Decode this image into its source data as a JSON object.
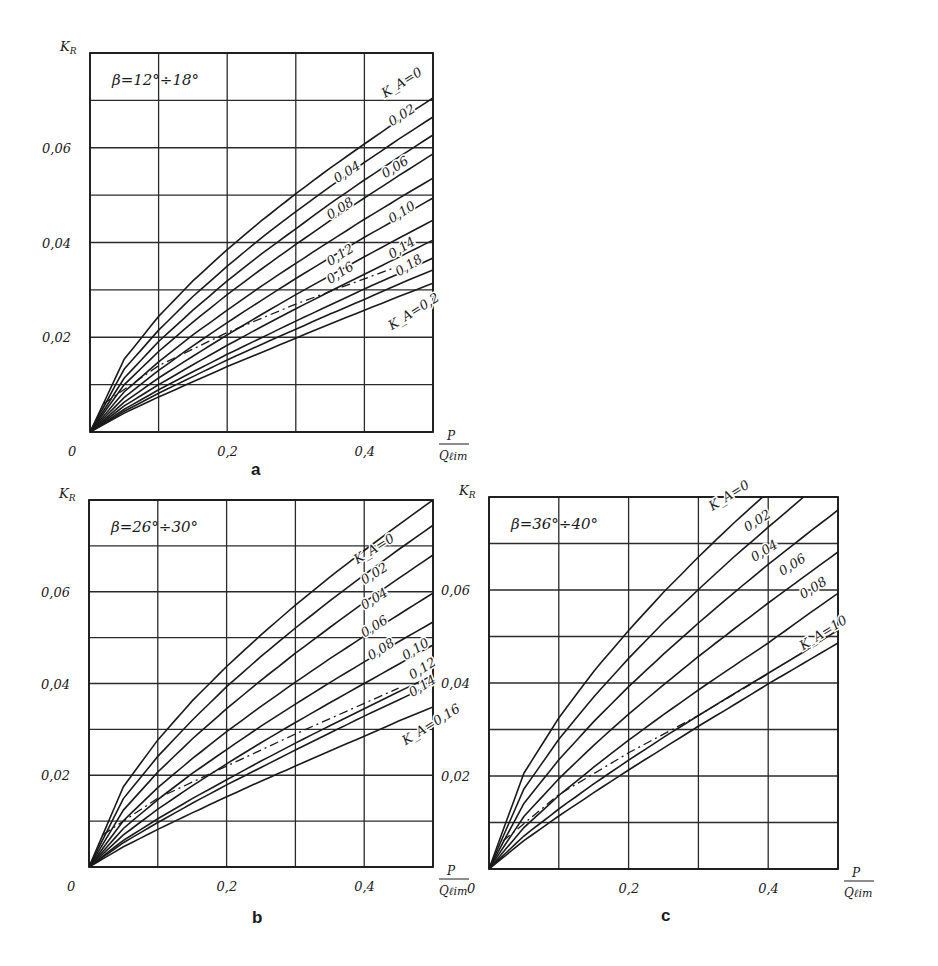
{
  "chart_data": [
    {
      "panel": "a",
      "type": "line",
      "title": "β=12°÷18°",
      "xlabel": "P / Q_lim",
      "ylabel": "K_R",
      "xlim": [
        0,
        0.5
      ],
      "ylim": [
        0,
        0.08
      ],
      "grid": true,
      "x_ticks": [
        "0",
        "0,2",
        "0,4"
      ],
      "y_ticks": [
        "0,02",
        "0,04",
        "0,06"
      ],
      "x": [
        0,
        0.05,
        0.1,
        0.15,
        0.2,
        0.25,
        0.3,
        0.35,
        0.4,
        0.45,
        0.5
      ],
      "series": [
        {
          "name": "K_A=0",
          "label": "K_A=0",
          "values": [
            0,
            0.0154,
            0.0244,
            0.0319,
            0.0385,
            0.0446,
            0.0503,
            0.0557,
            0.0608,
            0.0658,
            0.0705
          ]
        },
        {
          "name": "K_A=0.02",
          "label": "0,02",
          "values": [
            0,
            0.0133,
            0.0215,
            0.0286,
            0.035,
            0.041,
            0.0465,
            0.0518,
            0.0569,
            0.0618,
            0.0665
          ]
        },
        {
          "name": "K_A=0.04",
          "label": "0,04",
          "values": [
            0,
            0.0114,
            0.0191,
            0.0257,
            0.0319,
            0.0376,
            0.0429,
            0.0482,
            0.0532,
            0.058,
            0.0627
          ]
        },
        {
          "name": "K_A=0.06",
          "label": "0,06",
          "values": [
            0,
            0.01,
            0.017,
            0.0232,
            0.029,
            0.0344,
            0.0396,
            0.0446,
            0.0494,
            0.0541,
            0.0587
          ]
        },
        {
          "name": "K_A=0.08",
          "label": "0,08",
          "values": [
            0,
            0.0085,
            0.0148,
            0.0205,
            0.0257,
            0.0308,
            0.0356,
            0.0403,
            0.0449,
            0.0493,
            0.0536
          ]
        },
        {
          "name": "K_A=0.10",
          "label": "0,10",
          "values": [
            0,
            0.0073,
            0.013,
            0.0182,
            0.0231,
            0.0278,
            0.0324,
            0.0368,
            0.0411,
            0.0452,
            0.0494
          ]
        },
        {
          "name": "K_A=0.12",
          "label": "0,12",
          "values": [
            0,
            0.0063,
            0.0114,
            0.016,
            0.0205,
            0.0248,
            0.029,
            0.033,
            0.037,
            0.0409,
            0.0447
          ]
        },
        {
          "name": "K_A=0.14",
          "label": "0,14",
          "values": [
            0,
            0.0055,
            0.01,
            0.0142,
            0.0183,
            0.0222,
            0.026,
            0.0297,
            0.0333,
            0.0369,
            0.0405
          ]
        },
        {
          "name": "K_A=0.16",
          "label": "0,16",
          "values": [
            0,
            0.0048,
            0.0089,
            0.0127,
            0.0164,
            0.0199,
            0.0234,
            0.0268,
            0.0302,
            0.0334,
            0.0367
          ]
        },
        {
          "name": "K_A=0.18",
          "label": "0,18",
          "values": [
            0,
            0.0044,
            0.0082,
            0.0117,
            0.0152,
            0.0185,
            0.0217,
            0.0249,
            0.028,
            0.0312,
            0.0342
          ]
        },
        {
          "name": "K_A=0.2",
          "label": "K_A=0,2",
          "values": [
            0,
            0.004,
            0.0074,
            0.0106,
            0.0138,
            0.0168,
            0.0198,
            0.0228,
            0.0257,
            0.0286,
            0.0314
          ]
        }
      ],
      "dashed_line": {
        "x": [
          0.02,
          0.1,
          0.2,
          0.3,
          0.45
        ],
        "y": [
          0.006,
          0.014,
          0.021,
          0.027,
          0.035
        ]
      }
    },
    {
      "panel": "b",
      "type": "line",
      "title": "β=26°÷30°",
      "xlabel": "P / Q_lim",
      "ylabel": "K_R",
      "xlim": [
        0,
        0.5
      ],
      "ylim": [
        0,
        0.08
      ],
      "grid": true,
      "x_ticks": [
        "0",
        "0,2",
        "0,4"
      ],
      "y_ticks": [
        "0,02",
        "0,04",
        "0,06"
      ],
      "x": [
        0,
        0.05,
        0.1,
        0.15,
        0.2,
        0.25,
        0.3,
        0.35,
        0.4,
        0.45,
        0.5
      ],
      "series": [
        {
          "name": "K_A=0",
          "label": "K_A=0",
          "values": [
            0,
            0.0175,
            0.0277,
            0.0362,
            0.0437,
            0.0506,
            0.0571,
            0.0632,
            0.069,
            0.0746,
            0.08
          ]
        },
        {
          "name": "K_A=0.02",
          "label": "0,02",
          "values": [
            0,
            0.0149,
            0.0241,
            0.032,
            0.0393,
            0.0459,
            0.0521,
            0.058,
            0.0637,
            0.0692,
            0.0745
          ]
        },
        {
          "name": "K_A=0.04",
          "label": "0,04",
          "values": [
            0,
            0.0124,
            0.0207,
            0.0279,
            0.0345,
            0.0407,
            0.0466,
            0.0522,
            0.0577,
            0.0629,
            0.068
          ]
        },
        {
          "name": "K_A=0.06",
          "label": "0,06",
          "values": [
            0,
            0.0101,
            0.0173,
            0.0236,
            0.0295,
            0.035,
            0.0403,
            0.0454,
            0.0503,
            0.055,
            0.0597
          ]
        },
        {
          "name": "K_A=0.08",
          "label": "0,08",
          "values": [
            0,
            0.0084,
            0.0147,
            0.0204,
            0.0256,
            0.0307,
            0.0355,
            0.0402,
            0.0447,
            0.0491,
            0.0534
          ]
        },
        {
          "name": "K_A=0.10",
          "label": "0,10",
          "values": [
            0,
            0.007,
            0.0126,
            0.0177,
            0.0225,
            0.0271,
            0.0315,
            0.0358,
            0.04,
            0.0442,
            0.0484
          ]
        },
        {
          "name": "K_A=0.12",
          "label": "0,12",
          "values": [
            0,
            0.0058,
            0.0105,
            0.0149,
            0.019,
            0.0231,
            0.027,
            0.0308,
            0.0345,
            0.0382,
            0.0418
          ]
        },
        {
          "name": "K_A=0.14",
          "label": "0,14",
          "values": [
            0,
            0.0053,
            0.0097,
            0.0139,
            0.0179,
            0.0217,
            0.0255,
            0.0292,
            0.0329,
            0.0364,
            0.04
          ]
        },
        {
          "name": "K_A=0.16",
          "label": "K_A=0,16",
          "values": [
            0,
            0.0044,
            0.0082,
            0.0118,
            0.0153,
            0.0187,
            0.022,
            0.0253,
            0.0285,
            0.0318,
            0.0349
          ]
        }
      ],
      "dashed_line": {
        "x": [
          0.02,
          0.1,
          0.2,
          0.3,
          0.45
        ],
        "y": [
          0.007,
          0.015,
          0.022,
          0.029,
          0.039
        ]
      }
    },
    {
      "panel": "c",
      "type": "line",
      "title": "β=36°÷40°",
      "xlabel": "P / Q_lim",
      "ylabel": "K_R",
      "xlim": [
        0,
        0.5
      ],
      "ylim": [
        0,
        0.08
      ],
      "grid": true,
      "x_ticks": [
        "0",
        "0,2",
        "0,4"
      ],
      "y_ticks": [
        "0,02",
        "0,04",
        "0,06"
      ],
      "x": [
        0,
        0.05,
        0.1,
        0.15,
        0.2,
        0.25,
        0.3,
        0.35,
        0.4,
        0.45,
        0.5
      ],
      "series": [
        {
          "name": "K_A=0",
          "label": "K_A=0",
          "values": [
            0,
            0.0206,
            0.0325,
            0.0425,
            0.0513,
            0.0595,
            0.0671,
            0.0743,
            0.0811,
            0.0877,
            0.094
          ]
        },
        {
          "name": "K_A=0.02",
          "label": "0,02",
          "values": [
            0,
            0.0172,
            0.0279,
            0.037,
            0.0453,
            0.053,
            0.0601,
            0.067,
            0.0735,
            0.0799,
            0.086
          ]
        },
        {
          "name": "K_A=0.04",
          "label": "0,04",
          "values": [
            0,
            0.0141,
            0.0235,
            0.0317,
            0.0392,
            0.0462,
            0.0529,
            0.0593,
            0.0655,
            0.0714,
            0.0772
          ]
        },
        {
          "name": "K_A=0.06",
          "label": "0,06",
          "values": [
            0,
            0.0113,
            0.0194,
            0.0266,
            0.0333,
            0.0396,
            0.0457,
            0.0515,
            0.0572,
            0.0627,
            0.0682
          ]
        },
        {
          "name": "K_A=0.08",
          "label": "0,08",
          "values": [
            0,
            0.0089,
            0.0158,
            0.0219,
            0.0277,
            0.0332,
            0.0385,
            0.0436,
            0.0486,
            0.054,
            0.0593
          ]
        },
        {
          "name": "K_A=10",
          "label": "K_A=10",
          "values": [
            0,
            0.0071,
            0.0129,
            0.0183,
            0.0234,
            0.0283,
            0.033,
            0.0376,
            0.0421,
            0.0466,
            0.0514
          ]
        },
        {
          "name": "lower",
          "label": "",
          "values": [
            0,
            0.0061,
            0.0114,
            0.0164,
            0.0213,
            0.026,
            0.0307,
            0.0352,
            0.0398,
            0.0442,
            0.0486
          ]
        }
      ],
      "dashed_line": {
        "x": [
          0.02,
          0.1,
          0.2,
          0.3,
          0.4
        ],
        "y": [
          0.006,
          0.016,
          0.025,
          0.033,
          0.042
        ]
      }
    }
  ],
  "panels": {
    "a": {
      "letter": "a",
      "title": "β=12°÷18°",
      "y_axis_label": "K",
      "y_axis_sub": "R",
      "x_label_num": "P",
      "x_label_den": "Q",
      "x_label_den_sub": "ℓim"
    },
    "b": {
      "letter": "b",
      "title": "β=26°÷30°",
      "y_axis_label": "K",
      "y_axis_sub": "R",
      "x_label_num": "P",
      "x_label_den": "Q",
      "x_label_den_sub": "ℓim"
    },
    "c": {
      "letter": "c",
      "title": "β=36°÷40°",
      "y_axis_label": "K",
      "y_axis_sub": "R",
      "x_label_num": "P",
      "x_label_den": "Q",
      "x_label_den_sub": "ℓim"
    }
  },
  "style": {
    "line_color": "#1a1a1a",
    "grid_color": "#2a2a2a",
    "background": "#ffffff"
  }
}
